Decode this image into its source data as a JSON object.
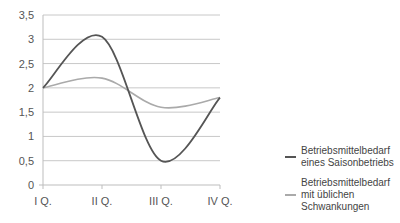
{
  "chart_data": {
    "type": "line",
    "title": "",
    "xlabel": "",
    "ylabel": "",
    "categories": [
      "I Q.",
      "II Q.",
      "III Q.",
      "IV Q."
    ],
    "ylim": [
      0,
      3.5
    ],
    "yticks": [
      0,
      0.5,
      1,
      1.5,
      2,
      2.5,
      3,
      3.5
    ],
    "ytick_labels": [
      "0",
      "0,5",
      "1",
      "1,5",
      "2",
      "2,5",
      "3",
      "3,5"
    ],
    "grid": true,
    "smooth": true,
    "legend_position": "right",
    "series": [
      {
        "name": "Betriebsmittelbedarf eines Saisonbetriebs",
        "color": "#555555",
        "values": [
          2,
          3.05,
          0.5,
          1.8
        ]
      },
      {
        "name": "Betriebsmittelbedarf mit üblichen Schwankungen",
        "color": "#aaaaaa",
        "values": [
          2,
          2.2,
          1.6,
          1.8
        ]
      }
    ]
  }
}
